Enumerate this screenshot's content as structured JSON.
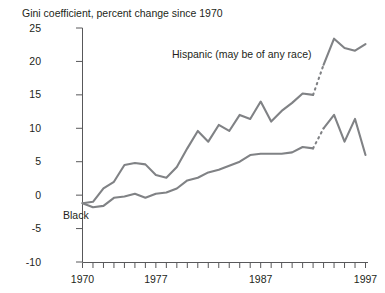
{
  "chart_data": {
    "type": "line",
    "title": "Gini coefficient, percent change since 1970",
    "xlabel": "",
    "ylabel": "",
    "xlim": [
      1970,
      1997
    ],
    "ylim": [
      -10,
      25
    ],
    "ytick_labels": [
      "25",
      "20",
      "15",
      "10",
      "5",
      "0",
      "-5",
      "-10"
    ],
    "ytick_values": [
      25,
      20,
      15,
      10,
      5,
      0,
      -5,
      -10
    ],
    "xtick_labels": [
      "1970",
      "1977",
      "1987",
      "1997"
    ],
    "xtick_values": [
      1970,
      1977,
      1987,
      1997
    ],
    "xtick_all": [
      1970,
      1971,
      1972,
      1973,
      1974,
      1975,
      1976,
      1977,
      1978,
      1979,
      1980,
      1981,
      1982,
      1983,
      1984,
      1985,
      1986,
      1987,
      1988,
      1989,
      1990,
      1991,
      1992,
      1993,
      1994,
      1995,
      1996,
      1997
    ],
    "grid": false,
    "legend": "inline-annotations",
    "line_color": "#808285",
    "axis_color": "#58585a",
    "break_note": "dotted segment between 1992 and 1993 indicates series break",
    "series": [
      {
        "name": "Hispanic (may be of any race)",
        "label": "Hispanic (may be of any race)",
        "x": [
          1970,
          1971,
          1972,
          1973,
          1974,
          1975,
          1976,
          1977,
          1978,
          1979,
          1980,
          1981,
          1982,
          1983,
          1984,
          1985,
          1986,
          1987,
          1988,
          1989,
          1990,
          1991,
          1992
        ],
        "values": [
          -1.2,
          -1.0,
          1.0,
          2.0,
          4.5,
          4.8,
          4.6,
          3.0,
          2.6,
          4.2,
          7.0,
          9.6,
          8.0,
          10.5,
          9.6,
          12.0,
          11.4,
          14.0,
          11.0,
          12.6,
          13.8,
          15.2,
          15.0
        ],
        "break_x": [
          1992,
          1993
        ],
        "break_values": [
          15.0,
          19.5
        ],
        "x2": [
          1993,
          1994,
          1995,
          1996,
          1997
        ],
        "values2": [
          19.5,
          23.4,
          22.0,
          21.6,
          22.6
        ]
      },
      {
        "name": "Black",
        "label": "Black",
        "x": [
          1970,
          1971,
          1972,
          1973,
          1974,
          1975,
          1976,
          1977,
          1978,
          1979,
          1980,
          1981,
          1982,
          1983,
          1984,
          1985,
          1986,
          1987,
          1988,
          1989,
          1990,
          1991,
          1992
        ],
        "values": [
          -1.2,
          -1.8,
          -1.6,
          -0.4,
          -0.2,
          0.2,
          -0.4,
          0.2,
          0.4,
          1.0,
          2.2,
          2.6,
          3.4,
          3.8,
          4.4,
          5.0,
          6.0,
          6.2,
          6.2,
          6.2,
          6.4,
          7.2,
          7.0
        ],
        "break_x": [
          1992,
          1993
        ],
        "break_values": [
          7.0,
          10.0
        ],
        "x2": [
          1993,
          1994,
          1995,
          1996,
          1997
        ],
        "values2": [
          10.0,
          12.0,
          8.0,
          11.4,
          6.0
        ]
      }
    ],
    "annotations": [
      {
        "text": "Hispanic (may be of any race)",
        "x_px": 172,
        "y_px": 58
      },
      {
        "text": "Black",
        "x_px": 63,
        "y_px": 219
      }
    ]
  }
}
